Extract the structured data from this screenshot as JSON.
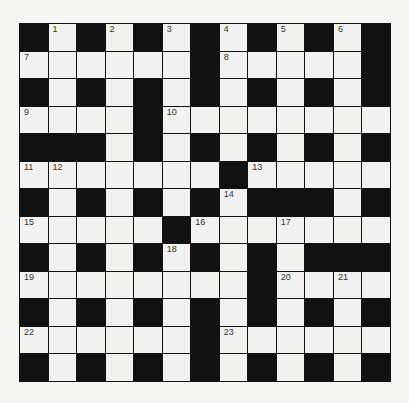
{
  "puzzle": {
    "type": "crossword",
    "rows": 13,
    "cols": 13,
    "colors": {
      "black": "#111111",
      "white": "#f1f1ef",
      "background": "#f5f5f3",
      "number": "#333333"
    },
    "layout": [
      "#.#.#.#.#.#.#",
      "......#.....#",
      "#.#.#.#.#.#.#",
      "....#........",
      "###.#.#.#.#.#",
      ".......#.....",
      "#.#.#.#.###.#",
      ".....#.......",
      "#.#.#.#.#.###",
      "........#....",
      "#.#.#.#.#.#.#",
      "......#......",
      "#.#.#.#.#.#.#"
    ],
    "numbers": [
      {
        "r": 0,
        "c": 1,
        "n": "1"
      },
      {
        "r": 0,
        "c": 3,
        "n": "2"
      },
      {
        "r": 0,
        "c": 5,
        "n": "3"
      },
      {
        "r": 0,
        "c": 7,
        "n": "4"
      },
      {
        "r": 0,
        "c": 9,
        "n": "5"
      },
      {
        "r": 0,
        "c": 11,
        "n": "6"
      },
      {
        "r": 1,
        "c": 0,
        "n": "7"
      },
      {
        "r": 1,
        "c": 7,
        "n": "8"
      },
      {
        "r": 3,
        "c": 0,
        "n": "9"
      },
      {
        "r": 3,
        "c": 5,
        "n": "10"
      },
      {
        "r": 5,
        "c": 0,
        "n": "11"
      },
      {
        "r": 5,
        "c": 1,
        "n": "12"
      },
      {
        "r": 5,
        "c": 8,
        "n": "13"
      },
      {
        "r": 6,
        "c": 7,
        "n": "14"
      },
      {
        "r": 7,
        "c": 0,
        "n": "15"
      },
      {
        "r": 7,
        "c": 6,
        "n": "16"
      },
      {
        "r": 7,
        "c": 9,
        "n": "17"
      },
      {
        "r": 8,
        "c": 5,
        "n": "18"
      },
      {
        "r": 9,
        "c": 0,
        "n": "19"
      },
      {
        "r": 9,
        "c": 9,
        "n": "20"
      },
      {
        "r": 9,
        "c": 11,
        "n": "21"
      },
      {
        "r": 11,
        "c": 0,
        "n": "22"
      },
      {
        "r": 11,
        "c": 7,
        "n": "23"
      }
    ]
  }
}
